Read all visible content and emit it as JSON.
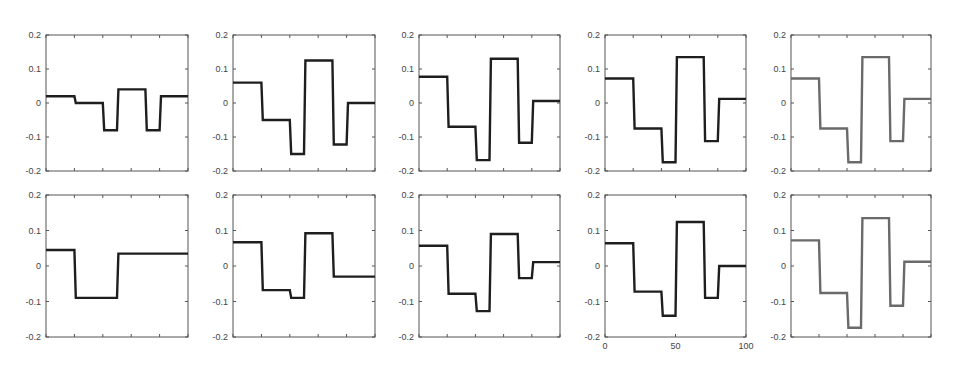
{
  "figure": {
    "background": "#ffffff",
    "axis_color": "#555555",
    "line_colors": {
      "dark": "#1e1e1e",
      "gray": "#6a6a6a"
    }
  },
  "chart_data": [
    {
      "type": "line",
      "row": 0,
      "col": 0,
      "title": "",
      "xlabel": "",
      "ylabel": "",
      "xlim": [
        0,
        100
      ],
      "ylim": [
        -0.2,
        0.2
      ],
      "yticks": [
        -0.2,
        -0.1,
        0,
        0.1,
        0.2
      ],
      "yticklabels": [
        "-0.2",
        "-0.1",
        "0",
        "0.1",
        "0.2"
      ],
      "xticks": [
        0,
        20,
        40,
        60,
        80,
        100
      ],
      "xticklabels": [],
      "grid": false,
      "line_color": "dark",
      "x": [
        0,
        20,
        21,
        40,
        41,
        50,
        51,
        70,
        71,
        80,
        81,
        100
      ],
      "y": [
        0.02,
        0.02,
        0.0,
        0.0,
        -0.08,
        -0.08,
        0.04,
        0.04,
        -0.08,
        -0.08,
        0.02,
        0.02
      ]
    },
    {
      "type": "line",
      "row": 0,
      "col": 1,
      "title": "",
      "xlabel": "",
      "ylabel": "",
      "xlim": [
        0,
        100
      ],
      "ylim": [
        -0.2,
        0.2
      ],
      "yticks": [
        -0.2,
        -0.1,
        0,
        0.1,
        0.2
      ],
      "yticklabels": [
        "-0.2",
        "-0.1",
        "0",
        "0.1",
        "0.2"
      ],
      "xticks": [
        0,
        20,
        40,
        60,
        80,
        100
      ],
      "xticklabels": [],
      "grid": false,
      "line_color": "dark",
      "x": [
        0,
        20,
        21,
        40,
        41,
        50,
        51,
        70,
        71,
        80,
        81,
        100
      ],
      "y": [
        0.06,
        0.06,
        -0.05,
        -0.05,
        -0.15,
        -0.15,
        0.125,
        0.125,
        -0.122,
        -0.122,
        0.0,
        0.0
      ]
    },
    {
      "type": "line",
      "row": 0,
      "col": 2,
      "title": "",
      "xlabel": "",
      "ylabel": "",
      "xlim": [
        0,
        100
      ],
      "ylim": [
        -0.2,
        0.2
      ],
      "yticks": [
        -0.2,
        -0.1,
        0,
        0.1,
        0.2
      ],
      "yticklabels": [
        "-0.2",
        "-0.1",
        "0",
        "0.1",
        "0.2"
      ],
      "xticks": [
        0,
        20,
        40,
        60,
        80,
        100
      ],
      "xticklabels": [],
      "grid": false,
      "line_color": "dark",
      "x": [
        0,
        20,
        21,
        40,
        41,
        50,
        51,
        70,
        71,
        80,
        81,
        100
      ],
      "y": [
        0.077,
        0.077,
        -0.07,
        -0.07,
        -0.168,
        -0.168,
        0.13,
        0.13,
        -0.117,
        -0.117,
        0.006,
        0.006
      ]
    },
    {
      "type": "line",
      "row": 0,
      "col": 3,
      "title": "",
      "xlabel": "",
      "ylabel": "",
      "xlim": [
        0,
        100
      ],
      "ylim": [
        -0.2,
        0.2
      ],
      "yticks": [
        -0.2,
        -0.1,
        0,
        0.1,
        0.2
      ],
      "yticklabels": [
        "-0.2",
        "-0.1",
        "0",
        "0.1",
        "0.2"
      ],
      "xticks": [
        0,
        20,
        40,
        60,
        80,
        100
      ],
      "xticklabels": [],
      "grid": false,
      "line_color": "dark",
      "x": [
        0,
        20,
        21,
        40,
        41,
        50,
        51,
        70,
        71,
        80,
        81,
        100
      ],
      "y": [
        0.072,
        0.072,
        -0.075,
        -0.075,
        -0.174,
        -0.174,
        0.135,
        0.135,
        -0.112,
        -0.112,
        0.012,
        0.012
      ]
    },
    {
      "type": "line",
      "row": 0,
      "col": 4,
      "title": "",
      "xlabel": "",
      "ylabel": "",
      "xlim": [
        0,
        100
      ],
      "ylim": [
        -0.2,
        0.2
      ],
      "yticks": [
        -0.2,
        -0.1,
        0,
        0.1,
        0.2
      ],
      "yticklabels": [
        "-0.2",
        "-0.1",
        "0",
        "0.1",
        "0.2"
      ],
      "xticks": [
        0,
        20,
        40,
        60,
        80,
        100
      ],
      "xticklabels": [],
      "grid": false,
      "line_color": "gray",
      "x": [
        0,
        20,
        21,
        40,
        41,
        50,
        51,
        70,
        71,
        80,
        81,
        100
      ],
      "y": [
        0.072,
        0.072,
        -0.075,
        -0.075,
        -0.174,
        -0.174,
        0.135,
        0.135,
        -0.112,
        -0.112,
        0.012,
        0.012
      ]
    },
    {
      "type": "line",
      "row": 1,
      "col": 0,
      "title": "",
      "xlabel": "",
      "ylabel": "",
      "xlim": [
        0,
        100
      ],
      "ylim": [
        -0.2,
        0.2
      ],
      "yticks": [
        -0.2,
        -0.1,
        0,
        0.1,
        0.2
      ],
      "yticklabels": [
        "-0.2",
        "-0.1",
        "0",
        "0.1",
        "0.2"
      ],
      "xticks": [
        0,
        20,
        40,
        60,
        80,
        100
      ],
      "xticklabels": [],
      "grid": false,
      "line_color": "dark",
      "x": [
        0,
        20,
        21,
        50,
        51,
        100
      ],
      "y": [
        0.045,
        0.045,
        -0.09,
        -0.09,
        0.035,
        0.035
      ]
    },
    {
      "type": "line",
      "row": 1,
      "col": 1,
      "title": "",
      "xlabel": "",
      "ylabel": "",
      "xlim": [
        0,
        100
      ],
      "ylim": [
        -0.2,
        0.2
      ],
      "yticks": [
        -0.2,
        -0.1,
        0,
        0.1,
        0.2
      ],
      "yticklabels": [
        "-0.2",
        "-0.1",
        "0",
        "0.1",
        "0.2"
      ],
      "xticks": [
        0,
        20,
        40,
        60,
        80,
        100
      ],
      "xticklabels": [],
      "grid": false,
      "line_color": "dark",
      "x": [
        0,
        20,
        21,
        40,
        41,
        50,
        51,
        70,
        71,
        100
      ],
      "y": [
        0.067,
        0.067,
        -0.068,
        -0.068,
        -0.09,
        -0.09,
        0.092,
        0.092,
        -0.03,
        -0.03
      ]
    },
    {
      "type": "line",
      "row": 1,
      "col": 2,
      "title": "",
      "xlabel": "",
      "ylabel": "",
      "xlim": [
        0,
        100
      ],
      "ylim": [
        -0.2,
        0.2
      ],
      "yticks": [
        -0.2,
        -0.1,
        0,
        0.1,
        0.2
      ],
      "yticklabels": [
        "-0.2",
        "-0.1",
        "0",
        "0.1",
        "0.2"
      ],
      "xticks": [
        0,
        20,
        40,
        60,
        80,
        100
      ],
      "xticklabels": [],
      "grid": false,
      "line_color": "dark",
      "x": [
        0,
        20,
        21,
        40,
        41,
        50,
        51,
        70,
        71,
        80,
        81,
        100
      ],
      "y": [
        0.057,
        0.057,
        -0.078,
        -0.078,
        -0.127,
        -0.127,
        0.09,
        0.09,
        -0.034,
        -0.034,
        0.011,
        0.011
      ]
    },
    {
      "type": "line",
      "row": 1,
      "col": 3,
      "title": "",
      "xlabel": "",
      "ylabel": "",
      "xlim": [
        0,
        100
      ],
      "ylim": [
        -0.2,
        0.2
      ],
      "yticks": [
        -0.2,
        -0.1,
        0,
        0.1,
        0.2
      ],
      "yticklabels": [
        "-0.2",
        "-0.1",
        "0",
        "0.1",
        "0.2"
      ],
      "xticks": [
        0,
        50,
        100
      ],
      "xticklabels": [
        "0",
        "50",
        "100"
      ],
      "grid": false,
      "line_color": "dark",
      "x": [
        0,
        20,
        21,
        40,
        41,
        50,
        51,
        70,
        71,
        80,
        81,
        100
      ],
      "y": [
        0.064,
        0.064,
        -0.072,
        -0.072,
        -0.14,
        -0.14,
        0.124,
        0.124,
        -0.09,
        -0.09,
        0.0,
        0.0
      ]
    },
    {
      "type": "line",
      "row": 1,
      "col": 4,
      "title": "",
      "xlabel": "",
      "ylabel": "",
      "xlim": [
        0,
        100
      ],
      "ylim": [
        -0.2,
        0.2
      ],
      "yticks": [
        -0.2,
        -0.1,
        0,
        0.1,
        0.2
      ],
      "yticklabels": [
        "-0.2",
        "-0.1",
        "0",
        "0.1",
        "0.2"
      ],
      "xticks": [
        0,
        20,
        40,
        60,
        80,
        100
      ],
      "xticklabels": [],
      "grid": false,
      "line_color": "gray",
      "x": [
        0,
        20,
        21,
        40,
        41,
        50,
        51,
        70,
        71,
        80,
        81,
        100
      ],
      "y": [
        0.072,
        0.072,
        -0.076,
        -0.076,
        -0.174,
        -0.174,
        0.135,
        0.135,
        -0.112,
        -0.112,
        0.012,
        0.012
      ]
    }
  ]
}
